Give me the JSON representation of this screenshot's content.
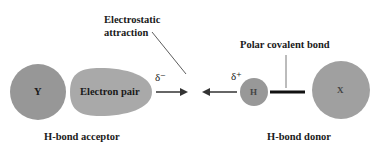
{
  "diagram": {
    "labels": {
      "electrostatic": "Electrostatic",
      "attraction": "attraction",
      "polar_bond": "Polar covalent bond",
      "acceptor": "H-bond acceptor",
      "donor": "H-bond donor",
      "delta_minus": "δ⁻",
      "delta_plus": "δ⁺"
    },
    "atoms": {
      "y": "Y",
      "electron_pair": "Electron pair",
      "h": "H",
      "x": "X"
    },
    "colors": {
      "atom_fill": "#9a9a9a",
      "lobe_fill": "#a8a8a8",
      "line": "#222222",
      "background": "#ffffff"
    }
  }
}
